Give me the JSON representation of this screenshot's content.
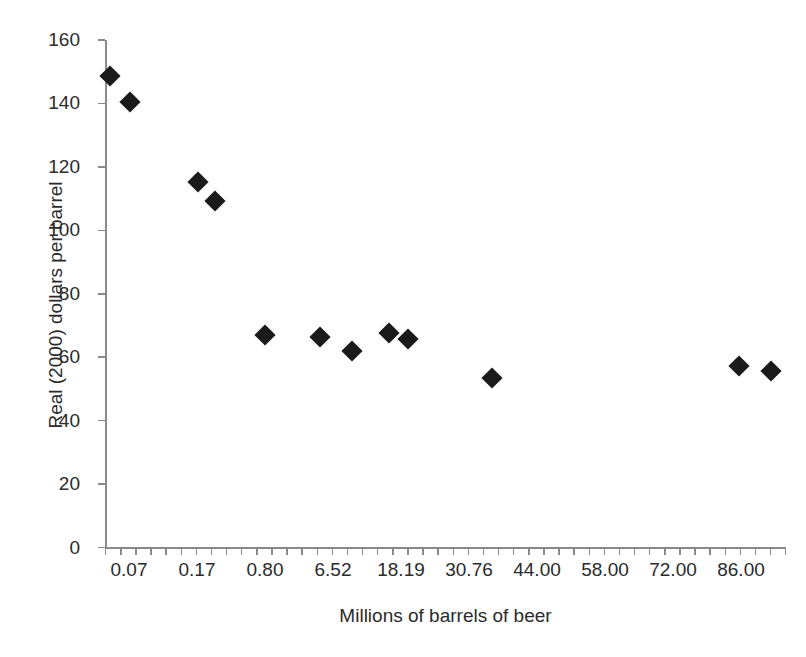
{
  "chart_data": {
    "type": "scatter",
    "title": "",
    "xlabel": "Millions of barrels of beer",
    "ylabel": "Real (2000) dollars per barrel",
    "marker": "filled-diamond",
    "marker_color": "#1a1a1a",
    "axis_color": "#8a8a8a",
    "grid": false,
    "legend": false,
    "ylim": [
      0,
      160
    ],
    "y_ticks": [
      "0",
      "20",
      "40",
      "60",
      "80",
      "100",
      "120",
      "140",
      "160"
    ],
    "x_tick_labels": [
      "0.07",
      "0.17",
      "0.80",
      "6.52",
      "18.19",
      "30.76",
      "44.00",
      "58.00",
      "72.00",
      "86.00"
    ],
    "x_axis_kind": "category-index",
    "x_minor_tick_count": 45,
    "points": [
      {
        "x": 0.07,
        "y": 148.6,
        "px": 110,
        "py": 76
      },
      {
        "x": 0.12,
        "y": 140.8,
        "px": 130,
        "py": 102
      },
      {
        "x": 0.45,
        "y": 115.5,
        "px": 198,
        "py": 182
      },
      {
        "x": 0.62,
        "y": 110.5,
        "px": 215,
        "py": 201
      },
      {
        "x": 2.1,
        "y": 67.6,
        "px": 265,
        "py": 335
      },
      {
        "x": 8.4,
        "y": 67.0,
        "px": 320,
        "py": 337
      },
      {
        "x": 13.5,
        "y": 62.6,
        "px": 352,
        "py": 351
      },
      {
        "x": 20.1,
        "y": 68.2,
        "px": 389,
        "py": 333
      },
      {
        "x": 23.9,
        "y": 66.3,
        "px": 408,
        "py": 339
      },
      {
        "x": 40.5,
        "y": 54.2,
        "px": 492,
        "py": 378
      },
      {
        "x": 90.0,
        "y": 58.0,
        "px": 739,
        "py": 366
      },
      {
        "x": 94.0,
        "y": 56.4,
        "px": 771,
        "py": 371
      }
    ]
  },
  "chart": {
    "x_axis_title": "Millions of barrels of beer",
    "y_axis_title": "Real (2000) dollars per barrel"
  }
}
